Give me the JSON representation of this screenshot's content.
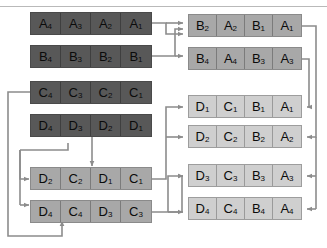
{
  "diagram": {
    "colors": {
      "dark_block": "#585858",
      "mid_block": "#a8a8a8",
      "light_block": "#cfcfcf",
      "wire": "#8c8c8c",
      "background": "#ffffff",
      "top_rule": "#b9b9b9"
    },
    "left_column": [
      {
        "id": "left-row-1",
        "tone": "dark",
        "cells": [
          {
            "letter": "A",
            "index": "4"
          },
          {
            "letter": "A",
            "index": "3"
          },
          {
            "letter": "A",
            "index": "2"
          },
          {
            "letter": "A",
            "index": "1"
          }
        ]
      },
      {
        "id": "left-row-2",
        "tone": "dark",
        "cells": [
          {
            "letter": "B",
            "index": "4"
          },
          {
            "letter": "B",
            "index": "3"
          },
          {
            "letter": "B",
            "index": "2"
          },
          {
            "letter": "B",
            "index": "1"
          }
        ]
      },
      {
        "id": "left-row-3",
        "tone": "dark",
        "cells": [
          {
            "letter": "C",
            "index": "4"
          },
          {
            "letter": "C",
            "index": "3"
          },
          {
            "letter": "C",
            "index": "2"
          },
          {
            "letter": "C",
            "index": "1"
          }
        ]
      },
      {
        "id": "left-row-4",
        "tone": "dark",
        "cells": [
          {
            "letter": "D",
            "index": "4"
          },
          {
            "letter": "D",
            "index": "3"
          },
          {
            "letter": "D",
            "index": "2"
          },
          {
            "letter": "D",
            "index": "1"
          }
        ]
      },
      {
        "id": "left-row-5",
        "tone": "mid",
        "cells": [
          {
            "letter": "D",
            "index": "2"
          },
          {
            "letter": "C",
            "index": "2"
          },
          {
            "letter": "D",
            "index": "1"
          },
          {
            "letter": "C",
            "index": "1"
          }
        ]
      },
      {
        "id": "left-row-6",
        "tone": "mid",
        "cells": [
          {
            "letter": "D",
            "index": "4"
          },
          {
            "letter": "C",
            "index": "4"
          },
          {
            "letter": "D",
            "index": "3"
          },
          {
            "letter": "C",
            "index": "3"
          }
        ]
      }
    ],
    "right_column": [
      {
        "id": "right-row-1",
        "tone": "mid",
        "cells": [
          {
            "letter": "B",
            "index": "2"
          },
          {
            "letter": "A",
            "index": "2"
          },
          {
            "letter": "B",
            "index": "1"
          },
          {
            "letter": "A",
            "index": "1"
          }
        ]
      },
      {
        "id": "right-row-2",
        "tone": "mid",
        "cells": [
          {
            "letter": "B",
            "index": "4"
          },
          {
            "letter": "A",
            "index": "4"
          },
          {
            "letter": "B",
            "index": "3"
          },
          {
            "letter": "A",
            "index": "3"
          }
        ]
      },
      {
        "id": "right-row-3",
        "tone": "light",
        "cells": [
          {
            "letter": "D",
            "index": "1"
          },
          {
            "letter": "C",
            "index": "1"
          },
          {
            "letter": "B",
            "index": "1"
          },
          {
            "letter": "A",
            "index": "1"
          }
        ]
      },
      {
        "id": "right-row-4",
        "tone": "light",
        "cells": [
          {
            "letter": "D",
            "index": "2"
          },
          {
            "letter": "C",
            "index": "2"
          },
          {
            "letter": "B",
            "index": "2"
          },
          {
            "letter": "A",
            "index": "2"
          }
        ]
      },
      {
        "id": "right-row-5",
        "tone": "light",
        "cells": [
          {
            "letter": "D",
            "index": "3"
          },
          {
            "letter": "C",
            "index": "3"
          },
          {
            "letter": "B",
            "index": "3"
          },
          {
            "letter": "A",
            "index": "3"
          }
        ]
      },
      {
        "id": "right-row-6",
        "tone": "light",
        "cells": [
          {
            "letter": "D",
            "index": "4"
          },
          {
            "letter": "C",
            "index": "4"
          },
          {
            "letter": "B",
            "index": "4"
          },
          {
            "letter": "A",
            "index": "4"
          }
        ]
      }
    ]
  }
}
